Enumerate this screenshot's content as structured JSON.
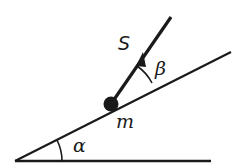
{
  "diagram": {
    "colors": {
      "stroke": "#1a1a1a",
      "background": "#ffffff"
    },
    "labels": {
      "rod": "S",
      "rod_angle": "β",
      "mass": "m",
      "incline_angle": "α"
    },
    "elements": {
      "ground_line": {
        "x1": 15,
        "y1": 161,
        "x2": 211,
        "y2": 161
      },
      "incline_line": {
        "x1": 15,
        "y1": 161,
        "x2": 231,
        "y2": 52
      },
      "mass": {
        "cx": 111,
        "cy": 104,
        "r": 7
      },
      "rod": {
        "x1": 111,
        "y1": 104,
        "x2": 171,
        "y2": 17
      },
      "arrowhead": {
        "tip_x": 144,
        "tip_y": 56
      },
      "beta_arc_radius": 46,
      "alpha_arc_radius": 47
    }
  }
}
